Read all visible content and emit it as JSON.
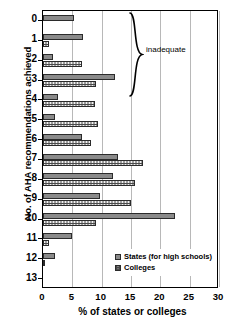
{
  "chart_data": {
    "type": "bar",
    "orientation": "horizontal",
    "title": "",
    "xlabel": "% of states or colleges",
    "ylabel": "No. of AHA recommendations achieved",
    "categories": [
      "0",
      "1",
      "2",
      "3",
      "4",
      "5",
      "6",
      "7",
      "8",
      "9",
      "10",
      "11",
      "12",
      "13"
    ],
    "series": [
      {
        "name": "States (for high schools)",
        "key": "states",
        "values": [
          5.3,
          6.9,
          1.7,
          12.3,
          2.6,
          2.0,
          6.7,
          12.8,
          12.0,
          9.7,
          22.5,
          5.0,
          2.0,
          0.0
        ]
      },
      {
        "name": "Colleges",
        "key": "colleges",
        "values": [
          0.0,
          1.0,
          6.7,
          9.0,
          8.8,
          9.4,
          8.1,
          17.0,
          15.7,
          15.0,
          9.0,
          1.0,
          0.3,
          0.0
        ]
      }
    ],
    "xlim": [
      0,
      30
    ],
    "xticks": [
      0,
      5,
      10,
      15,
      20,
      25,
      30
    ],
    "xtick_labels": [
      "0",
      "5",
      "10",
      "15",
      "20",
      "25",
      "30"
    ],
    "grid": "vertical",
    "legend_position": "bottom-right",
    "annotations": [
      {
        "text": "inadequate",
        "covers_categories": [
          "0",
          "1",
          "2",
          "3",
          "4"
        ],
        "marker": "curly-brace"
      }
    ],
    "colors": {
      "states": "#8a8a8a",
      "colleges": "#f2f2f2",
      "outline": "#2b2b2b",
      "gridline": "#b8b8b8",
      "axis": "#000000",
      "background": "#ffffff"
    }
  },
  "legend": {
    "items": [
      {
        "label": "States (for high schools)",
        "key": "states"
      },
      {
        "label": "Colleges",
        "key": "colleges"
      }
    ]
  },
  "annotation": {
    "inadequate_label": "inadequate"
  }
}
